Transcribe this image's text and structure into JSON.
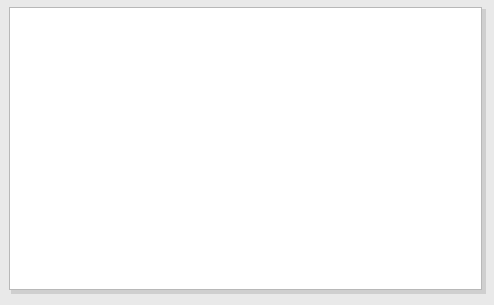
{
  "chart_data": {
    "type": "scatter",
    "title": "Average money market rate,\npercent, latest 5 years to 2003",
    "ylabel": "Average money market rate, percent, latest 5 years to 2003",
    "xlabel": "Average inflation rate, percent, latest 5 years to 2003",
    "xlim": [
      -10,
      30
    ],
    "ylim": [
      0,
      80
    ],
    "xticks": [
      -10,
      0,
      10,
      20,
      30
    ],
    "xtick_labels": [
      "–10",
      "0",
      "10",
      "20",
      "30"
    ],
    "yticks": [
      0,
      10,
      20,
      30,
      40,
      50,
      60,
      70,
      80
    ],
    "ytick_labels": [
      "0",
      "10",
      "20",
      "30",
      "40",
      "50",
      "60",
      "70",
      "80"
    ],
    "grid": false,
    "legend": null,
    "marker_color": "#8a8a8a",
    "axis_color": "#8c8c8c",
    "reference_line_x": 0,
    "points": [
      [
        -9.8,
        4.0
      ],
      [
        -9.6,
        9.5
      ],
      [
        -9.5,
        13.0
      ],
      [
        -9.3,
        11.2
      ],
      [
        -9.0,
        10.0
      ],
      [
        -8.9,
        12.6
      ],
      [
        -8.7,
        17.3
      ],
      [
        -8.6,
        11.0
      ],
      [
        -8.5,
        9.6
      ],
      [
        -8.4,
        12.2
      ],
      [
        -8.3,
        10.5
      ],
      [
        -8.2,
        13.3
      ],
      [
        -8.1,
        11.6
      ],
      [
        -8.0,
        8.4
      ],
      [
        -7.9,
        11.9
      ],
      [
        -7.8,
        10.2
      ],
      [
        -7.7,
        12.8
      ],
      [
        -7.6,
        11.4
      ],
      [
        -7.5,
        3.6
      ],
      [
        -7.4,
        12.0
      ],
      [
        -7.3,
        10.8
      ],
      [
        -7.2,
        13.6
      ],
      [
        -7.1,
        11.3
      ],
      [
        -7.0,
        9.8
      ],
      [
        -6.9,
        12.4
      ],
      [
        -6.8,
        11.7
      ],
      [
        -6.7,
        10.3
      ],
      [
        -6.6,
        13.1
      ],
      [
        -6.5,
        12.1
      ],
      [
        -6.4,
        11.0
      ],
      [
        -6.3,
        14.6
      ],
      [
        -6.2,
        10.6
      ],
      [
        -6.1,
        12.7
      ],
      [
        -6.0,
        8.2
      ],
      [
        -5.9,
        11.5
      ],
      [
        -5.8,
        13.8
      ],
      [
        -5.7,
        12.3
      ],
      [
        -5.6,
        10.9
      ],
      [
        -5.5,
        15.2
      ],
      [
        -5.4,
        11.8
      ],
      [
        -5.3,
        13.4
      ],
      [
        -5.2,
        9.4
      ],
      [
        -5.1,
        12.9
      ],
      [
        -5.0,
        14.1
      ],
      [
        -4.9,
        11.1
      ],
      [
        -4.8,
        16.0
      ],
      [
        -4.7,
        12.5
      ],
      [
        -4.6,
        13.9
      ],
      [
        -4.5,
        10.4
      ],
      [
        -4.4,
        15.6
      ],
      [
        -4.3,
        12.2
      ],
      [
        -4.2,
        14.4
      ],
      [
        -4.1,
        21.4
      ],
      [
        -4.0,
        13.2
      ],
      [
        -3.9,
        11.3
      ],
      [
        -3.8,
        16.4
      ],
      [
        -3.7,
        14.8
      ],
      [
        -3.6,
        12.6
      ],
      [
        -3.5,
        18.0
      ],
      [
        -3.4,
        15.0
      ],
      [
        -3.3,
        13.5
      ],
      [
        -3.2,
        11.9
      ],
      [
        -3.1,
        16.8
      ],
      [
        -3.0,
        14.2
      ],
      [
        -2.9,
        12.8
      ],
      [
        -2.8,
        9.2
      ],
      [
        -2.7,
        17.2
      ],
      [
        -2.6,
        15.4
      ],
      [
        -2.5,
        13.0
      ],
      [
        -2.4,
        18.6
      ],
      [
        -2.3,
        16.2
      ],
      [
        -2.2,
        14.0
      ],
      [
        -2.1,
        11.0
      ],
      [
        -2.0,
        19.0
      ],
      [
        -1.9,
        16.6
      ],
      [
        -1.8,
        13.8
      ],
      [
        -1.7,
        20.4
      ],
      [
        -1.6,
        17.0
      ],
      [
        -1.5,
        15.2
      ],
      [
        -1.4,
        12.4
      ],
      [
        -1.3,
        18.2
      ],
      [
        -1.2,
        16.0
      ],
      [
        -1.1,
        19.4
      ],
      [
        -1.0,
        14.6
      ],
      [
        -0.9,
        17.6
      ],
      [
        -0.8,
        11.6
      ],
      [
        -5.3,
        46.0
      ],
      [
        -4.2,
        43.0
      ],
      [
        -3.6,
        40.0
      ],
      [
        -2.7,
        36.0
      ],
      [
        0.1,
        21.4
      ],
      [
        0.5,
        19.0
      ],
      [
        0.6,
        16.2
      ],
      [
        0.7,
        15.4
      ],
      [
        1.5,
        16.6
      ],
      [
        3.3,
        28.0
      ],
      [
        3.4,
        31.0
      ],
      [
        3.6,
        16.4
      ],
      [
        7.3,
        27.0
      ],
      [
        10.0,
        35.4
      ],
      [
        10.0,
        74.0
      ],
      [
        28.8,
        52.6
      ]
    ]
  },
  "figure": {
    "background_color": "#e9e9e9",
    "panel_color": "#ffffff"
  }
}
